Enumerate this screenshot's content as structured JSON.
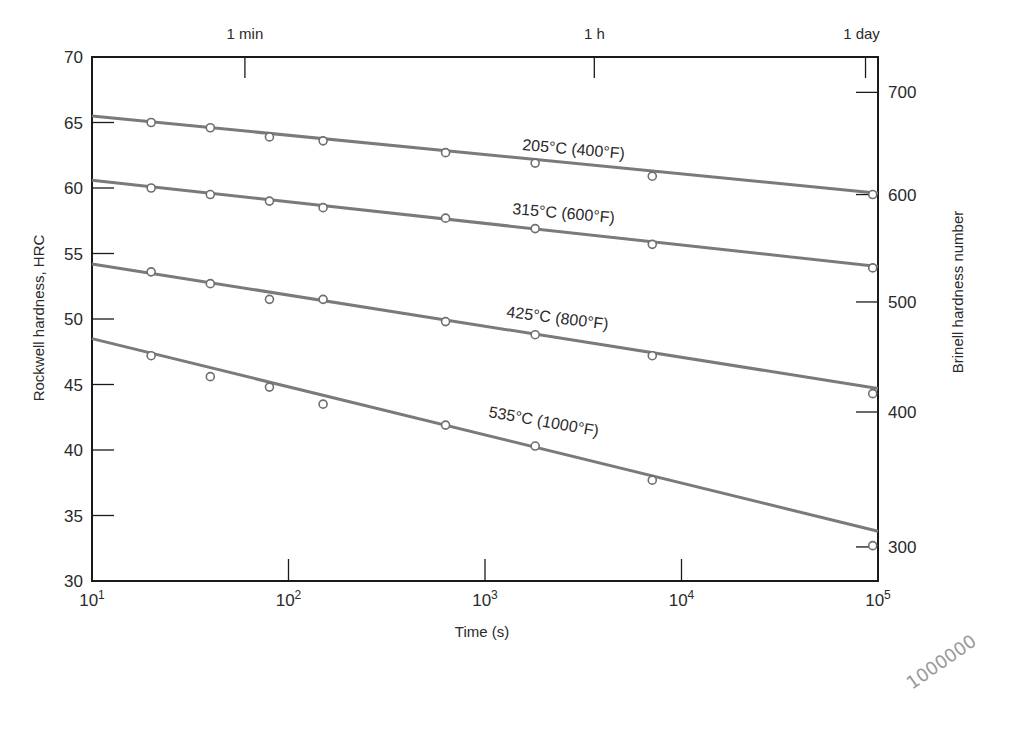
{
  "chart_data": {
    "type": "line",
    "title": "",
    "xlabel": "Time (s)",
    "ylabel": "Rockwell hardness, HRC",
    "ylabel_right": "Brinell hardness number",
    "xscale": "log",
    "xlim": [
      10,
      100000
    ],
    "ylim": [
      30,
      70
    ],
    "grid": false,
    "legend": "inline labels on lines",
    "x_ticks": [
      {
        "value": 10,
        "base": "10",
        "exp": "1"
      },
      {
        "value": 100,
        "base": "10",
        "exp": "2"
      },
      {
        "value": 1000,
        "base": "10",
        "exp": "3"
      },
      {
        "value": 10000,
        "base": "10",
        "exp": "4"
      },
      {
        "value": 100000,
        "base": "10",
        "exp": "5"
      }
    ],
    "y_ticks": [
      30,
      35,
      40,
      45,
      50,
      55,
      60,
      65,
      70
    ],
    "y_right_ticks": [
      {
        "label": "700",
        "hrc": 67.3
      },
      {
        "label": "600",
        "hrc": 59.5
      },
      {
        "label": "500",
        "hrc": 51.3
      },
      {
        "label": "400",
        "hrc": 42.9
      },
      {
        "label": "300",
        "hrc": 32.6
      }
    ],
    "top_axis_ticks": [
      {
        "label": "1 min",
        "value": 60
      },
      {
        "label": "1 h",
        "value": 3600
      },
      {
        "label": "1 day",
        "value": 86400
      }
    ],
    "x": [
      20,
      40,
      80,
      150,
      630,
      1800,
      7100,
      94000
    ],
    "series": [
      {
        "name": "205°C (400°F)",
        "values": [
          65.0,
          64.6,
          63.9,
          63.6,
          62.7,
          61.9,
          60.9,
          59.5
        ],
        "fit": [
          65.5,
          59.6
        ],
        "label_pos": {
          "x": 522,
          "y": 150,
          "rot": 5
        }
      },
      {
        "name": "315°C (600°F)",
        "values": [
          60.0,
          59.5,
          59.0,
          58.5,
          57.7,
          56.9,
          55.7,
          53.9
        ],
        "fit": [
          60.6,
          54.0
        ],
        "label_pos": {
          "x": 512,
          "y": 214,
          "rot": 5
        }
      },
      {
        "name": "425°C (800°F)",
        "values": [
          53.6,
          52.7,
          51.5,
          51.5,
          49.8,
          48.8,
          47.2,
          44.3
        ],
        "fit": [
          54.2,
          44.7
        ],
        "label_pos": {
          "x": 506,
          "y": 317,
          "rot": 7
        }
      },
      {
        "name": "535°C (1000°F)",
        "values": [
          47.2,
          45.6,
          44.8,
          43.5,
          41.9,
          40.3,
          37.7,
          32.7
        ],
        "fit": [
          48.5,
          33.8
        ],
        "label_pos": {
          "x": 488,
          "y": 417,
          "rot": 10
        }
      }
    ],
    "line_color": "#7a7a7a",
    "axis_color": "#1a1a1a",
    "annotation_handwritten": "1000000"
  }
}
